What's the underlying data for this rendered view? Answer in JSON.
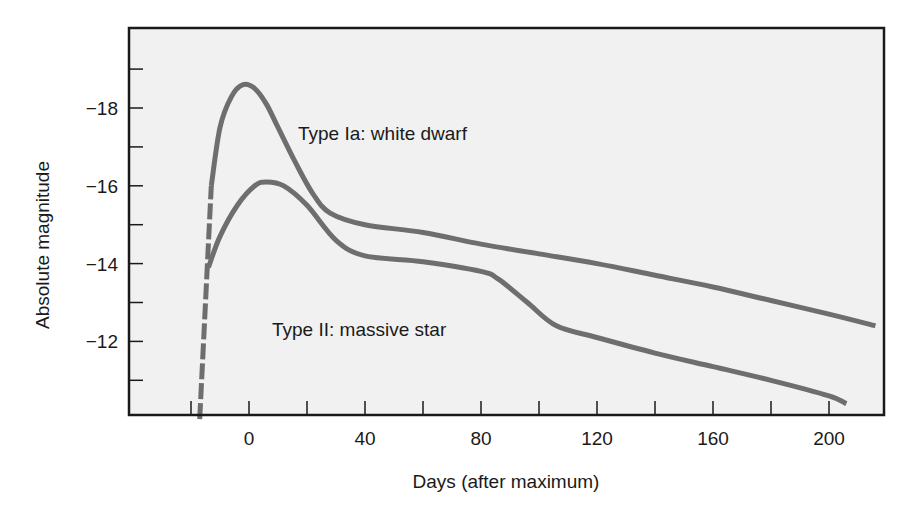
{
  "chart_data": {
    "type": "line",
    "title": "",
    "xlabel": "Days (after maximum)",
    "ylabel": "Absolute magnitude",
    "xlim": [
      -40,
      220
    ],
    "ylim": [
      -10,
      -20
    ],
    "y_inverted": true,
    "grid": false,
    "legend": "none (inline annotations)",
    "x_ticks": [
      0,
      40,
      80,
      120,
      160,
      200
    ],
    "x_tick_labels": [
      "0",
      "40",
      "80",
      "120",
      "160",
      "200"
    ],
    "x_minor_ticks": [
      -20,
      20,
      60,
      100,
      140,
      180
    ],
    "y_ticks": [
      -18,
      -16,
      -14,
      -12
    ],
    "y_tick_labels": [
      "−18",
      "−16",
      "−14",
      "−12"
    ],
    "y_minor_ticks": [
      -19,
      -17,
      -15,
      -13,
      -11
    ],
    "series": [
      {
        "name": "Type Ia: white dwarf",
        "color": "#6e6e6e",
        "dashed_segment": {
          "x": [
            -17,
            -13
          ],
          "y": [
            -10,
            -16
          ]
        },
        "x": [
          -13,
          -10,
          -6,
          -2,
          2,
          6,
          10,
          16,
          22,
          28,
          40,
          60,
          80,
          100,
          120,
          140,
          160,
          180,
          200,
          216
        ],
        "y": [
          -16.0,
          -17.5,
          -18.3,
          -18.6,
          -18.5,
          -18.1,
          -17.5,
          -16.6,
          -15.8,
          -15.3,
          -15.0,
          -14.8,
          -14.5,
          -14.25,
          -14.0,
          -13.7,
          -13.4,
          -13.05,
          -12.7,
          -12.4
        ]
      },
      {
        "name": "Type II: massive star",
        "color": "#6e6e6e",
        "x": [
          -14,
          -10,
          -4,
          2,
          6,
          12,
          20,
          30,
          40,
          60,
          80,
          86,
          96,
          106,
          120,
          140,
          160,
          180,
          200,
          206
        ],
        "y": [
          -13.9,
          -14.7,
          -15.5,
          -16.0,
          -16.1,
          -16.0,
          -15.5,
          -14.6,
          -14.2,
          -14.05,
          -13.8,
          -13.6,
          -13.0,
          -12.4,
          -12.1,
          -11.7,
          -11.35,
          -11.0,
          -10.6,
          -10.4
        ]
      }
    ],
    "annotations": [
      {
        "text": "Type Ia: white dwarf",
        "x": 17,
        "y": -17.3
      },
      {
        "text": "Type II: massive star",
        "x": 8,
        "y": -12.2
      }
    ]
  }
}
